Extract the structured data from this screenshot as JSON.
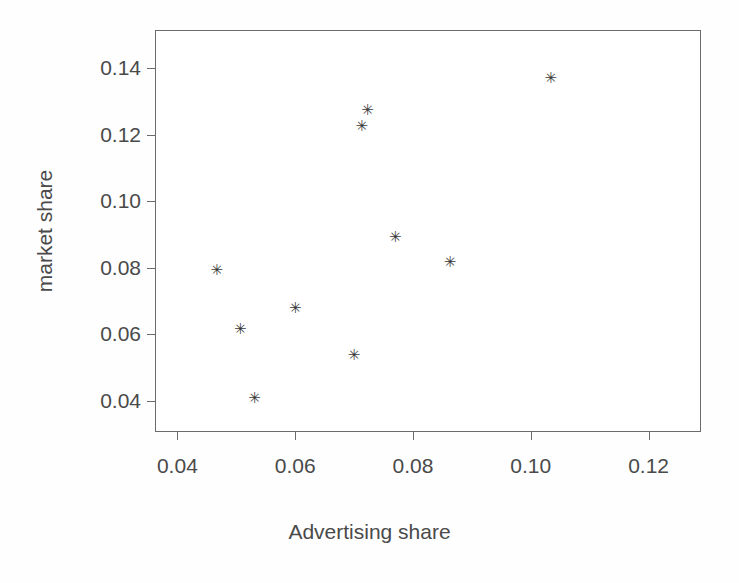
{
  "chart_data": {
    "type": "scatter",
    "title": "",
    "xlabel": "Advertising share",
    "ylabel": "market share",
    "xlim": [
      0.0362,
      0.1289
    ],
    "ylim": [
      0.0307,
      0.1514
    ],
    "xticks": [
      0.04,
      0.06,
      0.08,
      0.1,
      0.12
    ],
    "xticklabels": [
      "0.04",
      "0.06",
      "0.08",
      "0.10",
      "0.12"
    ],
    "yticks": [
      0.04,
      0.06,
      0.08,
      0.1,
      0.12,
      0.14
    ],
    "yticklabels": [
      "0.04",
      "0.06",
      "0.08",
      "0.10",
      "0.12",
      "0.14"
    ],
    "grid": false,
    "legend": false,
    "marker": "star",
    "marker_glyph": "✳",
    "marker_color": "#3a3a3a",
    "frame_color": "#6b6b6b",
    "background": "#ffffff",
    "points": [
      {
        "x": 0.0467,
        "y": 0.079
      },
      {
        "x": 0.0507,
        "y": 0.0612
      },
      {
        "x": 0.0531,
        "y": 0.0407
      },
      {
        "x": 0.06,
        "y": 0.0675
      },
      {
        "x": 0.07,
        "y": 0.0535
      },
      {
        "x": 0.0713,
        "y": 0.1222
      },
      {
        "x": 0.0723,
        "y": 0.1272
      },
      {
        "x": 0.077,
        "y": 0.0889
      },
      {
        "x": 0.0863,
        "y": 0.0813
      },
      {
        "x": 0.1034,
        "y": 0.1368
      }
    ]
  }
}
